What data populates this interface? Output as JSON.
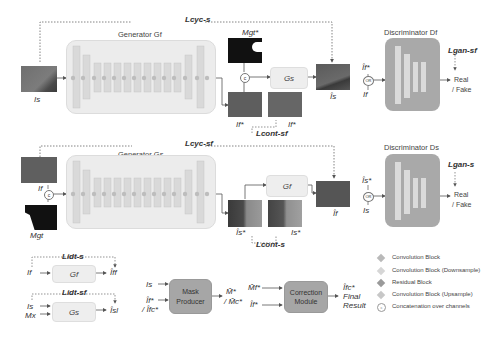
{
  "top_row": {
    "generator_title": "Generator Gf",
    "discriminator_title": "Discriminator Df",
    "loss_cyc": "Lcyc-s",
    "loss_cont": "Lcont-sf",
    "loss_gan": "Lgan-sf",
    "input_label": "Is",
    "mask_label": "Mgt*",
    "out1_label": "If*",
    "out2_label": "If*",
    "inner_generator": "Gs",
    "recon_label": "Îs",
    "disc_input_top": "Îf*",
    "disc_input_bottom": "If",
    "or_label": "OR",
    "disc_output": [
      "Real",
      "/ Fake"
    ]
  },
  "middle_row": {
    "generator_title": "Generator Gs",
    "discriminator_title": "Discriminator Ds",
    "loss_cyc": "Lcyc-sf",
    "loss_cont": "Lcont-s",
    "loss_gan": "Lgan-s",
    "input_label": "If",
    "mask_label": "Mgt",
    "out1_label": "Îs*",
    "out2_label": "Is*",
    "inner_generator": "Gf",
    "recon_label": "Îf",
    "disc_input_top": "Îs*",
    "disc_input_bottom": "Is",
    "or_label": "OR",
    "disc_output": [
      "Real",
      "/ Fake"
    ]
  },
  "identity": {
    "loss_idt_s": "Lidt-s",
    "loss_idt_sf": "Lidt-sf",
    "box1": {
      "label": "Gf",
      "input": "If",
      "output": "Îff"
    },
    "box2": {
      "label": "Gs",
      "inputs": [
        "Is",
        "Mx"
      ],
      "output": "Îsl"
    }
  },
  "mask_producer": {
    "label": "Mask Producer",
    "inputs": [
      "Is",
      "Îf*",
      "/ Îfc*"
    ],
    "outputs": [
      "M̂*",
      "/ M̂c*"
    ]
  },
  "correction_module": {
    "label": "Correction Module",
    "inputs": [
      "M̂f*",
      "Îf*"
    ],
    "outputs": [
      "Îfc*",
      "Final",
      "Result"
    ]
  },
  "legend": [
    {
      "icon": "conv-block-icon",
      "label": "Convolution Block",
      "color": "#b9b9b9"
    },
    {
      "icon": "conv-downsample-icon",
      "label": "Convolution Block (Downsample)",
      "color": "#d6d6d6"
    },
    {
      "icon": "residual-block-icon",
      "label": "Residual Block",
      "color": "#9a9a9a"
    },
    {
      "icon": "conv-upsample-icon",
      "label": "Convolution Block (Upsample)",
      "color": "#c7c7c7"
    },
    {
      "icon": "concat-icon",
      "label": "Concatenation over channels",
      "color": "#ffffff"
    }
  ]
}
